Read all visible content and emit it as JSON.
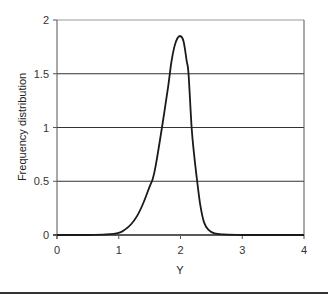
{
  "chart_data": {
    "type": "line",
    "title": "",
    "xlabel": "Y",
    "ylabel": "Frequency distribution",
    "xlim": [
      0,
      4
    ],
    "ylim": [
      0,
      2
    ],
    "x_ticks": [
      0,
      1,
      2,
      3,
      4
    ],
    "y_ticks": [
      0,
      0.5,
      1,
      1.5,
      2
    ],
    "x_tick_labels": [
      "0",
      "1",
      "2",
      "3",
      "4"
    ],
    "y_tick_labels": [
      "0",
      "0.5",
      "1",
      "1.5",
      "2"
    ],
    "grid": "horizontal",
    "legend": null,
    "series": [
      {
        "name": "Frequency distribution",
        "color": "#1a1a1a",
        "x": [
          0,
          0.5,
          0.8,
          1.0,
          1.1,
          1.2,
          1.3,
          1.4,
          1.5,
          1.55,
          1.6,
          1.7,
          1.8,
          1.85,
          1.9,
          1.95,
          2.0,
          2.05,
          2.1,
          2.13,
          2.18,
          2.22,
          2.27,
          2.32,
          2.38,
          2.45,
          2.55,
          2.7,
          3.0,
          3.5,
          4.0
        ],
        "y": [
          0,
          0,
          0.005,
          0.02,
          0.05,
          0.1,
          0.18,
          0.3,
          0.45,
          0.52,
          0.65,
          1.0,
          1.38,
          1.6,
          1.75,
          1.83,
          1.85,
          1.8,
          1.62,
          1.5,
          1.0,
          0.75,
          0.5,
          0.28,
          0.12,
          0.05,
          0.015,
          0.005,
          0,
          0,
          0
        ]
      }
    ]
  },
  "plot": {
    "left": 57,
    "right": 304,
    "top": 20,
    "bottom": 235
  },
  "colors": {
    "axis": "#555555",
    "grid": "#333333",
    "frame": "#999999",
    "line": "#1a1a1a"
  }
}
